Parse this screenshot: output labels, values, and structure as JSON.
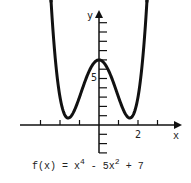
{
  "chart_data": {
    "type": "line",
    "function": "x^4 - 5x^2 + 7",
    "xlabel": "x",
    "ylabel": "y",
    "x_ticks": [
      -3,
      -2,
      -1,
      0,
      1,
      2,
      3
    ],
    "x_tick_labels": [
      {
        "value": 2,
        "label": "2"
      }
    ],
    "y_ticks": [
      -3,
      -2,
      -1,
      1,
      2,
      3,
      4,
      5,
      6,
      7,
      8,
      9,
      10,
      11
    ],
    "y_tick_labels": [
      {
        "value": 5,
        "label": "5"
      }
    ],
    "xlim": [
      -4,
      4
    ],
    "ylim": [
      -3,
      12
    ],
    "key_points": [
      {
        "x": -1.58,
        "y": 0.75,
        "note": "local minimum"
      },
      {
        "x": 0,
        "y": 7,
        "note": "local maximum"
      },
      {
        "x": 1.58,
        "y": 0.75,
        "note": "local minimum"
      }
    ],
    "grid": false,
    "arrows": "curve ends and axes have arrowheads"
  },
  "labels": {
    "y_axis": "y",
    "x_axis": "x",
    "y_tick_5": "5",
    "x_tick_2": "2",
    "caption_prefix": "f(x) = x",
    "caption_exp1": "4",
    "caption_mid": " - 5x",
    "caption_exp2": "2",
    "caption_suffix": " + 7"
  }
}
